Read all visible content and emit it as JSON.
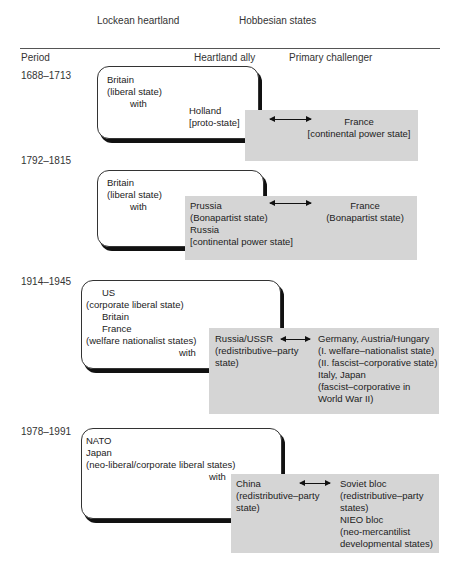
{
  "header": {
    "lockean_heartland": "Lockean heartland",
    "hobbesian_states": "Hobbesian states",
    "period": "Period",
    "heartland_ally": "Heartland ally",
    "primary_challenger": "Primary challenger"
  },
  "rows": [
    {
      "period": "1688–1713",
      "heartland": [
        "Britain",
        "(liberal state)",
        "with"
      ],
      "ally": [
        "Holland",
        "[proto-state]"
      ],
      "challenger": [
        "France",
        "[continental power state]"
      ]
    },
    {
      "period": "1792–1815",
      "heartland": [
        "Britain",
        "(liberal state)",
        "with"
      ],
      "ally": [
        "Prussia",
        "(Bonapartist state)",
        "Russia",
        "[continental power state]"
      ],
      "challenger": [
        "France",
        "(Bonapartist state)"
      ]
    },
    {
      "period": "1914–1945",
      "heartland": [
        "US",
        "(corporate liberal state)",
        "Britain",
        "France",
        "(welfare nationalist states)",
        "with"
      ],
      "ally": [
        "Russia/USSR",
        "(redistributive–party",
        "state)"
      ],
      "challenger": [
        "Germany, Austria/Hungary",
        "(I. welfare–nationalist state)",
        "(II. fascist–corporative state)",
        "Italy, Japan",
        "(fascist–corporative in",
        "World War II)"
      ]
    },
    {
      "period": "1978–1991",
      "heartland": [
        "NATO",
        "Japan",
        "(neo-liberal/corporate liberal states)",
        "with"
      ],
      "ally": [
        "China",
        "(redistributive–party",
        "state)"
      ],
      "challenger": [
        "Soviet bloc",
        "(redistributive–party",
        "states)",
        "NIEO bloc",
        "(neo-mercantilist",
        "developmental states)"
      ]
    }
  ],
  "colors": {
    "gray_box": "#d5d5d5",
    "shadow": "#111111"
  }
}
